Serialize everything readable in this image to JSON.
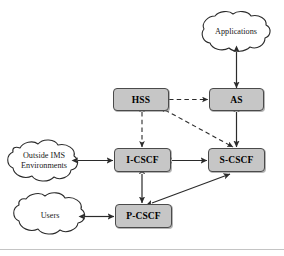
{
  "figure": {
    "background_color": "#ffffff",
    "box_fill_color": "#c6c6c6",
    "box_border_color": "#4a4a4a",
    "line_color": "#333333"
  },
  "nodes": {
    "hss": {
      "label": "HSS",
      "shape": "box"
    },
    "as": {
      "label": "AS",
      "shape": "box"
    },
    "i_cscf": {
      "label": "I-CSCF",
      "shape": "box"
    },
    "s_cscf": {
      "label": "S-CSCF",
      "shape": "box"
    },
    "p_cscf": {
      "label": "P-CSCF",
      "shape": "box"
    }
  },
  "clouds": {
    "applications": {
      "label": "Applications",
      "shape": "cloud"
    },
    "outside_ims": {
      "label": "Outside IMS\nEnvironments",
      "shape": "cloud"
    },
    "users": {
      "label": "Users",
      "shape": "cloud"
    }
  },
  "connections": [
    {
      "from": "applications",
      "to": "as",
      "style": "solid",
      "arrows": "both",
      "orientation": "vertical"
    },
    {
      "from": "hss",
      "to": "as",
      "style": "dashed",
      "arrows": "both",
      "orientation": "horizontal"
    },
    {
      "from": "hss",
      "to": "i_cscf",
      "style": "dashed",
      "arrows": "both",
      "orientation": "vertical"
    },
    {
      "from": "hss",
      "to": "s_cscf",
      "style": "dashed",
      "arrows": "both",
      "orientation": "diagonal"
    },
    {
      "from": "as",
      "to": "s_cscf",
      "style": "solid",
      "arrows": "both",
      "orientation": "vertical"
    },
    {
      "from": "outside_ims",
      "to": "i_cscf",
      "style": "solid",
      "arrows": "both",
      "orientation": "horizontal"
    },
    {
      "from": "i_cscf",
      "to": "s_cscf",
      "style": "solid",
      "arrows": "both",
      "orientation": "horizontal"
    },
    {
      "from": "i_cscf",
      "to": "p_cscf",
      "style": "solid",
      "arrows": "both",
      "orientation": "vertical"
    },
    {
      "from": "users",
      "to": "p_cscf",
      "style": "solid",
      "arrows": "both",
      "orientation": "horizontal"
    },
    {
      "from": "p_cscf",
      "to": "s_cscf",
      "style": "solid",
      "arrows": "both",
      "orientation": "diagonal"
    }
  ]
}
